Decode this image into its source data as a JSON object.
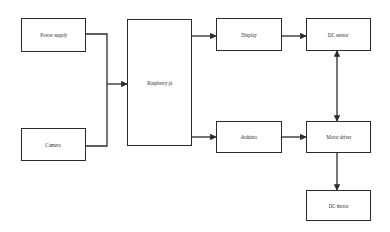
{
  "diagram": {
    "nodes": [
      {
        "id": "power-supply",
        "label": "Power supply"
      },
      {
        "id": "camera",
        "label": "Camera"
      },
      {
        "id": "raspberry-pi",
        "label": "Raspberry pi"
      },
      {
        "id": "display",
        "label": "Display"
      },
      {
        "id": "arduino",
        "label": "Arduino"
      },
      {
        "id": "dc-sensor",
        "label": "DC sensor"
      },
      {
        "id": "motor-driver",
        "label": "Motor driver"
      },
      {
        "id": "dc-motor",
        "label": "DC motor"
      }
    ],
    "edges": [
      {
        "from": "power-supply",
        "to": "raspberry-pi",
        "type": "arrow"
      },
      {
        "from": "camera",
        "to": "raspberry-pi",
        "type": "arrow"
      },
      {
        "from": "raspberry-pi",
        "to": "display",
        "type": "arrow"
      },
      {
        "from": "raspberry-pi",
        "to": "arduino",
        "type": "arrow"
      },
      {
        "from": "display",
        "to": "dc-sensor",
        "type": "arrow"
      },
      {
        "from": "arduino",
        "to": "motor-driver",
        "type": "arrow"
      },
      {
        "from": "dc-sensor",
        "to": "motor-driver",
        "type": "bidirectional"
      },
      {
        "from": "motor-driver",
        "to": "dc-motor",
        "type": "arrow"
      }
    ],
    "colors": {
      "stroke": "#2b2b2b",
      "background": "#ffffff"
    }
  }
}
